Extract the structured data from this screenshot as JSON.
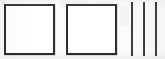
{
  "document": {
    "kind": "scanned-form-fragment",
    "background_color": "#fbfbfa",
    "ink_color": "#2b2b2d",
    "width_px": 165,
    "height_px": 59,
    "visible_text": ""
  },
  "checkboxes": [
    {
      "name": "checkbox-1",
      "label": "",
      "checked": false,
      "state_text": "",
      "x": 4,
      "y": 4,
      "width": 51,
      "height": 51
    },
    {
      "name": "checkbox-2",
      "label": "",
      "checked": false,
      "state_text": "",
      "x": 66,
      "y": 4,
      "width": 51,
      "height": 51
    }
  ],
  "tally_marks": {
    "name": "tally-marks",
    "count": 3,
    "count_text": "3",
    "orientation": "vertical",
    "color": "#232325",
    "lines": [
      {
        "x": 131,
        "y": 2,
        "width": 2,
        "height": 54
      },
      {
        "x": 143,
        "y": 2,
        "width": 2,
        "height": 54
      },
      {
        "x": 155,
        "y": 2,
        "width": 2,
        "height": 54
      }
    ]
  },
  "ghost_marks": [
    {
      "x": 60,
      "y": 1,
      "width": 30,
      "height": 7
    },
    {
      "x": 96,
      "y": 2,
      "width": 18,
      "height": 6
    },
    {
      "x": 72,
      "y": 18,
      "width": 14,
      "height": 13
    },
    {
      "x": 95,
      "y": 16,
      "width": 12,
      "height": 14
    },
    {
      "x": 120,
      "y": 6,
      "width": 9,
      "height": 20
    },
    {
      "x": 0,
      "y": 0,
      "width": 6,
      "height": 5
    }
  ]
}
